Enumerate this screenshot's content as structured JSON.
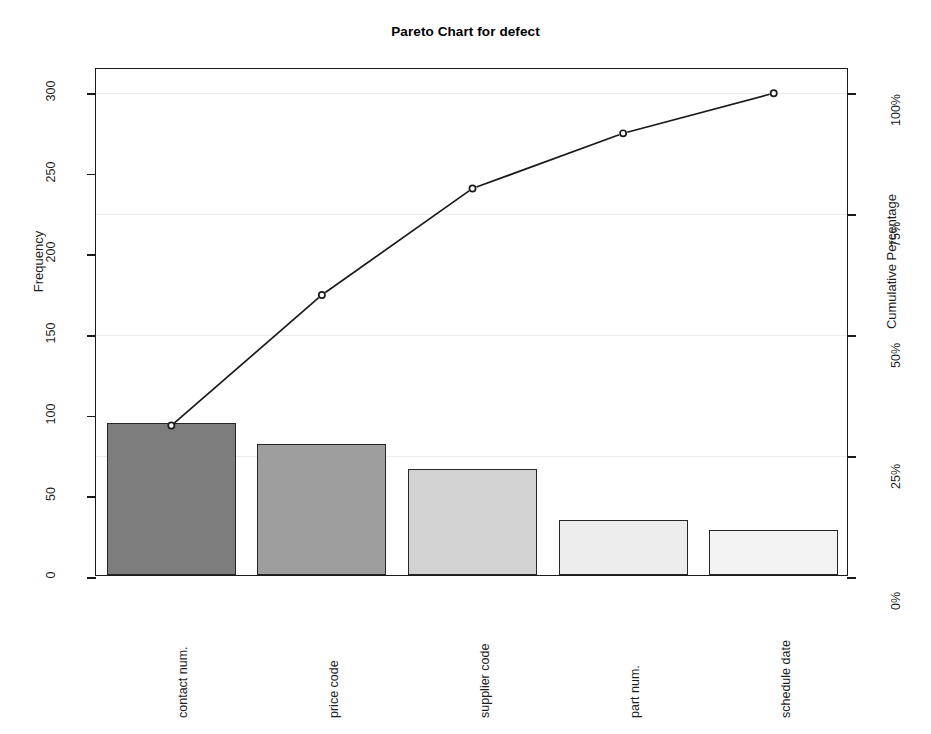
{
  "chart_data": {
    "type": "bar",
    "title": "Pareto Chart for defect",
    "xlabel": "",
    "ylabel": "Frequency",
    "y2label": "Cumulative Percentage",
    "categories": [
      "contact num.",
      "price code",
      "supplier code",
      "part num.",
      "schedule date"
    ],
    "values": [
      94,
      81,
      66,
      34,
      28
    ],
    "cumulative_percent": [
      31.3,
      58.3,
      80.3,
      91.7,
      100.0
    ],
    "ylim": [
      0,
      315
    ],
    "y2lim": [
      0,
      105
    ],
    "yticks": [
      0,
      50,
      100,
      150,
      200,
      250,
      300
    ],
    "ytick_labels": [
      "0",
      "50",
      "100",
      "150",
      "200",
      "250",
      "300"
    ],
    "y2ticks": [
      0,
      25,
      50,
      75,
      100
    ],
    "y2tick_labels": [
      "0%",
      "25%",
      "50%",
      "75%",
      "100%"
    ],
    "grid": true,
    "legend": "none",
    "total": 303,
    "bar_fills": [
      "#7d7d7d",
      "#9e9e9e",
      "#d2d2d2",
      "#ededed",
      "#f3f3f3"
    ],
    "bar_border_color": "#262626",
    "line_color": "#1a1a1a",
    "marker": "open-circle",
    "grid_color": "#ececec",
    "axis_color": "#1a1a1a"
  }
}
